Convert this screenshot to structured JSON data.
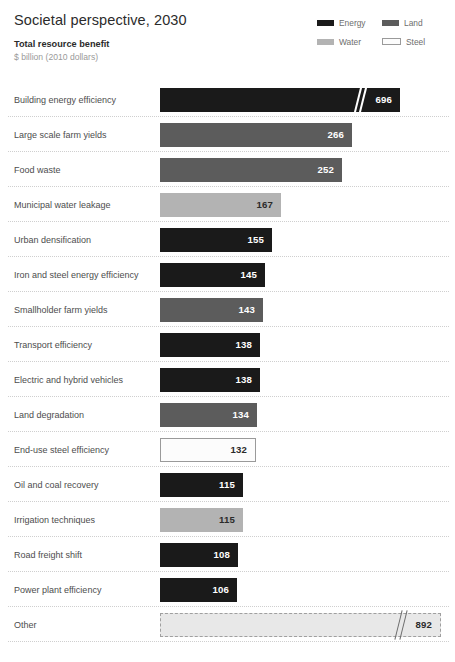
{
  "header": {
    "title": "Societal perspective, 2030",
    "subtitle": "Total resource benefit",
    "units": "$ billion (2010 dollars)"
  },
  "legend": {
    "items": [
      {
        "label": "Energy",
        "color": "#1a1a1a",
        "icon": "legend-swatch-energy"
      },
      {
        "label": "Land",
        "color": "#5c5c5c",
        "icon": "legend-swatch-land"
      },
      {
        "label": "Water",
        "color": "#b3b3b3",
        "icon": "legend-swatch-water"
      },
      {
        "label": "Steel",
        "color": "#fcfcfc",
        "icon": "legend-swatch-steel"
      }
    ]
  },
  "colors": {
    "energy": "#1a1a1a",
    "land": "#5c5c5c",
    "water": "#b3b3b3",
    "steel": "#fcfcfc",
    "other": "#e8e8e8",
    "separator": "#cfcfcf",
    "label_text": "#4d4d4d",
    "title_text": "#2b2b2b",
    "units_text": "#9a9a9a"
  },
  "chart_data": {
    "type": "bar",
    "orientation": "horizontal",
    "title": "Societal perspective, 2030",
    "subtitle": "Total resource benefit",
    "xlabel": "$ billion (2010 dollars)",
    "ylabel": "",
    "grid": false,
    "axis_break": true,
    "legend_position": "top-right",
    "value_unit": "$ billion (2010 dollars)",
    "categories": [
      "Building energy efficiency",
      "Large scale farm yields",
      "Food waste",
      "Municipal water leakage",
      "Urban densification",
      "Iron and steel energy efficiency",
      "Smallholder farm yields",
      "Transport efficiency",
      "Electric and hybrid vehicles",
      "Land degradation",
      "End-use steel efficiency",
      "Oil and coal recovery",
      "Irrigation techniques",
      "Road freight shift",
      "Power plant efficiency",
      "Other"
    ],
    "values": [
      696,
      266,
      252,
      167,
      155,
      145,
      143,
      138,
      138,
      134,
      132,
      115,
      115,
      108,
      106,
      892
    ],
    "series_by_resource": [
      "Energy",
      "Land",
      "Land",
      "Water",
      "Energy",
      "Energy",
      "Land",
      "Energy",
      "Energy",
      "Land",
      "Steel",
      "Energy",
      "Water",
      "Energy",
      "Energy",
      "Other"
    ],
    "bars": [
      {
        "label": "Building energy efficiency",
        "value": 696,
        "display_value": "696",
        "resource": "Energy",
        "style": "solid",
        "fill": "#1a1a1a",
        "value_color": "light",
        "bar_px": 240,
        "broken": true
      },
      {
        "label": "Large scale farm yields",
        "value": 266,
        "display_value": "266",
        "resource": "Land",
        "style": "solid",
        "fill": "#5c5c5c",
        "value_color": "light",
        "bar_px": 192,
        "broken": false
      },
      {
        "label": "Food waste",
        "value": 252,
        "display_value": "252",
        "resource": "Land",
        "style": "solid",
        "fill": "#5c5c5c",
        "value_color": "light",
        "bar_px": 182,
        "broken": false
      },
      {
        "label": "Municipal water leakage",
        "value": 167,
        "display_value": "167",
        "resource": "Water",
        "style": "solid",
        "fill": "#b3b3b3",
        "value_color": "dark",
        "bar_px": 121,
        "broken": false
      },
      {
        "label": "Urban densification",
        "value": 155,
        "display_value": "155",
        "resource": "Energy",
        "style": "solid",
        "fill": "#1a1a1a",
        "value_color": "light",
        "bar_px": 112,
        "broken": false
      },
      {
        "label": "Iron and steel energy efficiency",
        "value": 145,
        "display_value": "145",
        "resource": "Energy",
        "style": "solid",
        "fill": "#1a1a1a",
        "value_color": "light",
        "bar_px": 105,
        "broken": false
      },
      {
        "label": "Smallholder farm yields",
        "value": 143,
        "display_value": "143",
        "resource": "Land",
        "style": "solid",
        "fill": "#5c5c5c",
        "value_color": "light",
        "bar_px": 103,
        "broken": false
      },
      {
        "label": "Transport efficiency",
        "value": 138,
        "display_value": "138",
        "resource": "Energy",
        "style": "solid",
        "fill": "#1a1a1a",
        "value_color": "light",
        "bar_px": 100,
        "broken": false
      },
      {
        "label": "Electric and hybrid vehicles",
        "value": 138,
        "display_value": "138",
        "resource": "Energy",
        "style": "solid",
        "fill": "#1a1a1a",
        "value_color": "light",
        "bar_px": 100,
        "broken": false
      },
      {
        "label": "Land degradation",
        "value": 134,
        "display_value": "134",
        "resource": "Land",
        "style": "solid",
        "fill": "#5c5c5c",
        "value_color": "light",
        "bar_px": 97,
        "broken": false
      },
      {
        "label": "End-use steel efficiency",
        "value": 132,
        "display_value": "132",
        "resource": "Steel",
        "style": "outlined",
        "fill": "#fcfcfc",
        "value_color": "dark",
        "bar_px": 96,
        "broken": false
      },
      {
        "label": "Oil and coal recovery",
        "value": 115,
        "display_value": "115",
        "resource": "Energy",
        "style": "solid",
        "fill": "#1a1a1a",
        "value_color": "light",
        "bar_px": 83,
        "broken": false
      },
      {
        "label": "Irrigation techniques",
        "value": 115,
        "display_value": "115",
        "resource": "Water",
        "style": "solid",
        "fill": "#b3b3b3",
        "value_color": "dark",
        "bar_px": 83,
        "broken": false
      },
      {
        "label": "Road freight shift",
        "value": 108,
        "display_value": "108",
        "resource": "Energy",
        "style": "solid",
        "fill": "#1a1a1a",
        "value_color": "light",
        "bar_px": 78,
        "broken": false
      },
      {
        "label": "Power plant efficiency",
        "value": 106,
        "display_value": "106",
        "resource": "Energy",
        "style": "solid",
        "fill": "#1a1a1a",
        "value_color": "light",
        "bar_px": 77,
        "broken": false
      },
      {
        "label": "Other",
        "value": 892,
        "display_value": "892",
        "resource": "Other",
        "style": "dashed",
        "fill": "#e8e8e8",
        "value_color": "dark",
        "bar_px": 281,
        "broken": true
      }
    ]
  }
}
